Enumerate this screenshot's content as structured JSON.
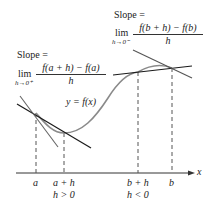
{
  "diagram": {
    "left_annotation": {
      "slope_label": "Slope =",
      "lim_label": "lim",
      "lim_sub": "h→0⁺",
      "numerator": "f(a + h) − f(a)",
      "denominator": "h"
    },
    "right_annotation": {
      "slope_label": "Slope =",
      "lim_label": "lim",
      "lim_sub": "h→0⁻",
      "numerator": "f(b + h) − f(b)",
      "denominator": "h"
    },
    "curve_label": "y = f(x)",
    "axis": {
      "x_label": "x",
      "ticks": [
        {
          "label": "a",
          "sub": ""
        },
        {
          "label": "a + h",
          "sub": "h > 0"
        },
        {
          "label": "b + h",
          "sub": "h < 0"
        },
        {
          "label": "b",
          "sub": ""
        }
      ]
    },
    "colors": {
      "curve": "#8a8a8a",
      "tangent": "#1a1a1a",
      "secant": "#555555",
      "dashed": "#555555",
      "axis": "#333333"
    }
  }
}
